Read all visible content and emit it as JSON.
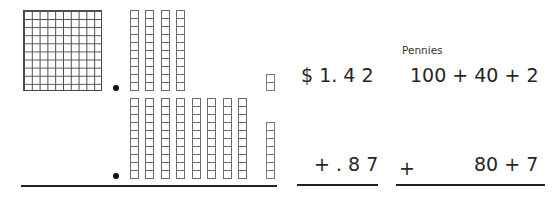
{
  "diagram": {
    "top_row": {
      "hundreds": 1,
      "tens": 4,
      "ones": 2,
      "money": "$ 1. 4 2",
      "expanded": "100 + 40 + 2"
    },
    "bottom_row": {
      "hundreds": 0,
      "tens": 8,
      "ones": 7,
      "money": "+ . 8 7",
      "plus_sign": "+",
      "expanded": "80 + 7"
    },
    "label": "Pennies",
    "colors": {
      "grid_line": "#4a4a4a",
      "text": "#262626",
      "dot": "#111111"
    }
  }
}
